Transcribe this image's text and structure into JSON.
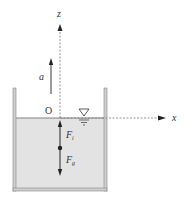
{
  "diagram": {
    "labels": {
      "z_axis": "z",
      "x_axis": "x",
      "origin": "O",
      "acceleration": "a",
      "inertial_force": "F",
      "inertial_force_sub": "i",
      "gravity_force": "F",
      "gravity_force_sub": "g"
    },
    "colors": {
      "liquid": "#e3e3e3",
      "wall": "#cfcfcf",
      "wall_stroke": "#888888",
      "axis": "#777777",
      "arrow": "#222222"
    }
  }
}
